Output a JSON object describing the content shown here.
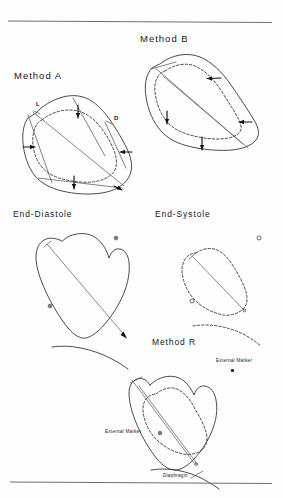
{
  "figure": {
    "type": "scientific-diagram",
    "background_color": "#fefefe",
    "ink_color": "#2b2b2b",
    "rules": {
      "top_rule": true,
      "bottom_rule": true
    }
  },
  "panels": {
    "method_a": {
      "title": "Method A",
      "contour_style_outer": "solid",
      "contour_style_inner": "dashed",
      "axis_labels": {
        "long_axis": "L",
        "diameter": "D"
      },
      "arrow_count": 5,
      "arrow_meaning": "inward wall motion"
    },
    "method_b": {
      "title": "Method B",
      "contour_style_outer": "solid",
      "contour_style_inner": "dashed",
      "arrow_count": 4,
      "arrow_meaning": "inward wall motion"
    },
    "end_diastole": {
      "title": "End-Diastole",
      "contour_style": "solid",
      "marker_count": 2,
      "has_diaphragm": true
    },
    "end_systole": {
      "title": "End-Systole",
      "contour_style": "dashed",
      "marker_count": 2,
      "has_diaphragm": true
    },
    "method_r": {
      "title": "Method R",
      "contour_style_outer": "solid",
      "contour_style_inner": "dashed",
      "marker_label_upper": "External Marker",
      "marker_label_lower": "External Marker",
      "diaphragm_label": "Diaphragm"
    }
  }
}
